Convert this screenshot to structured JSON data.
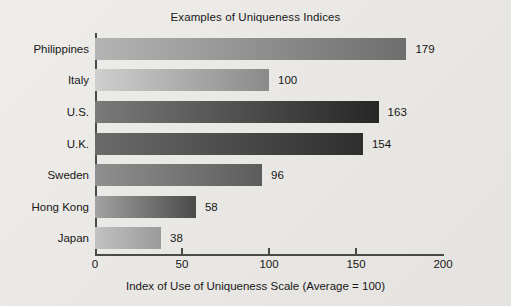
{
  "chart_data": {
    "type": "bar",
    "orientation": "horizontal",
    "title": "Examples of Uniqueness Indices",
    "xlabel": "Index of Use of Uniqueness Scale (Average = 100)",
    "ylabel": "",
    "xlim": [
      0,
      200
    ],
    "xticks": [
      0,
      50,
      100,
      150,
      200
    ],
    "xtick_labels": [
      "0",
      "50",
      "100",
      "150",
      "200"
    ],
    "grid": false,
    "legend": "none",
    "categories": [
      "Philippines",
      "Italy",
      "U.S.",
      "U.K.",
      "Sweden",
      "Hong Kong",
      "Japan"
    ],
    "values": [
      179,
      100,
      163,
      154,
      96,
      58,
      38
    ],
    "value_labels": [
      "179",
      "100",
      "163",
      "154",
      "96",
      "58",
      "38"
    ],
    "bars": [
      {
        "category": "Philippines",
        "value": 179,
        "label": "179",
        "color_start": "#b4b4b4",
        "color_end": "#6e6e6e"
      },
      {
        "category": "Italy",
        "value": 100,
        "label": "100",
        "color_start": "#cfcfcf",
        "color_end": "#8a8a8a"
      },
      {
        "category": "U.S.",
        "value": 163,
        "label": "163",
        "color_start": "#7a7a7a",
        "color_end": "#262626"
      },
      {
        "category": "U.K.",
        "value": 154,
        "label": "154",
        "color_start": "#6a6a6a",
        "color_end": "#2e2e2e"
      },
      {
        "category": "Sweden",
        "value": 96,
        "label": "96",
        "color_start": "#8f8f8f",
        "color_end": "#5c5c5c"
      },
      {
        "category": "Hong Kong",
        "value": 58,
        "label": "58",
        "color_start": "#a2a2a2",
        "color_end": "#4a4a4a"
      },
      {
        "category": "Japan",
        "value": 38,
        "label": "38",
        "color_start": "#c2c2c2",
        "color_end": "#9a9a9a"
      }
    ],
    "colors": {
      "background": "#eceae6",
      "axis": "#4a4a4a",
      "text": "#171717"
    }
  }
}
